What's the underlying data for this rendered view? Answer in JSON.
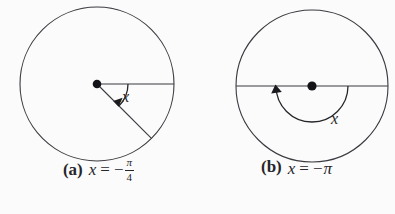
{
  "document": {
    "kind": "math-figure-pair",
    "background_color": "#fbfbfb",
    "stroke_color": "#3a3a40",
    "text_color": "#26262b"
  },
  "figures": [
    {
      "id": "a",
      "caption_label": "(a)",
      "variable": "x",
      "equals": "=",
      "minus": "−",
      "pi": "π",
      "denominator": "4",
      "caption_text": "(a) x = −π/4",
      "angle_label": "x",
      "angle_value_radians": -0.7853981634,
      "angle_value_text": "-π/4",
      "circle": {
        "cx": 97,
        "cy": 84,
        "r": 77
      },
      "center_dot": {
        "cx": 97,
        "cy": 84,
        "r": 4
      },
      "initial_ray": {
        "from_deg": 0,
        "label": "horizontal-radius-right"
      },
      "terminal_ray": {
        "to_deg": -45,
        "label": "radius-down-right"
      },
      "arc": {
        "start_deg": 0,
        "end_deg": -45,
        "radius": 31,
        "direction": "clockwise"
      },
      "arrow": {
        "at_deg": -45,
        "points": "clockwise"
      }
    },
    {
      "id": "b",
      "caption_label": "(b)",
      "variable": "x",
      "equals": "=",
      "minus": "−",
      "pi": "π",
      "denominator": null,
      "caption_text": "(b) x = −π",
      "angle_label": "x",
      "angle_value_radians": -3.1415926536,
      "angle_value_text": "-π",
      "circle": {
        "cx": 114,
        "cy": 86,
        "r": 76
      },
      "center_dot": {
        "cx": 114,
        "cy": 86,
        "r": 4.5
      },
      "initial_ray": {
        "from_deg": 0,
        "label": "horizontal-radius-right"
      },
      "terminal_ray": {
        "to_deg": 180,
        "label": "horizontal-radius-left"
      },
      "arc": {
        "start_deg": 0,
        "end_deg": -180,
        "radius": 36,
        "direction": "clockwise"
      },
      "arrow": {
        "at_deg": 180,
        "points": "clockwise"
      }
    }
  ]
}
